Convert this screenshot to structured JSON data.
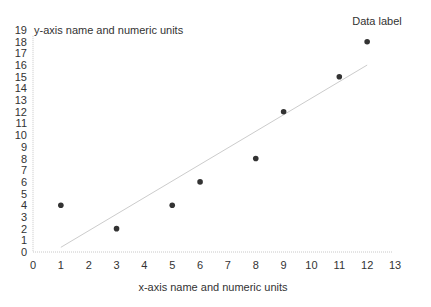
{
  "chart_data": {
    "type": "scatter",
    "title": "",
    "xlabel": "x-axis name and numeric units",
    "ylabel": "y-axis name and numeric units",
    "annotation": "Data label",
    "xlim": [
      0,
      13
    ],
    "ylim": [
      0,
      19
    ],
    "x_ticks": [
      0,
      1,
      2,
      3,
      4,
      5,
      6,
      7,
      8,
      9,
      10,
      11,
      12,
      13
    ],
    "y_ticks": [
      0,
      1,
      2,
      3,
      4,
      5,
      6,
      7,
      8,
      9,
      10,
      11,
      12,
      13,
      14,
      15,
      16,
      17,
      18,
      19
    ],
    "grid": false,
    "legend": null,
    "series": [
      {
        "name": "Data",
        "points": [
          {
            "x": 1,
            "y": 4
          },
          {
            "x": 3,
            "y": 2
          },
          {
            "x": 5,
            "y": 4
          },
          {
            "x": 6,
            "y": 6
          },
          {
            "x": 8,
            "y": 8
          },
          {
            "x": 9,
            "y": 12
          },
          {
            "x": 11,
            "y": 15
          },
          {
            "x": 12,
            "y": 18
          }
        ],
        "color": "#333333"
      }
    ],
    "trendline": {
      "x1": 1,
      "y1": 0.4,
      "x2": 12,
      "y2": 16,
      "color": "#cccccc"
    }
  }
}
